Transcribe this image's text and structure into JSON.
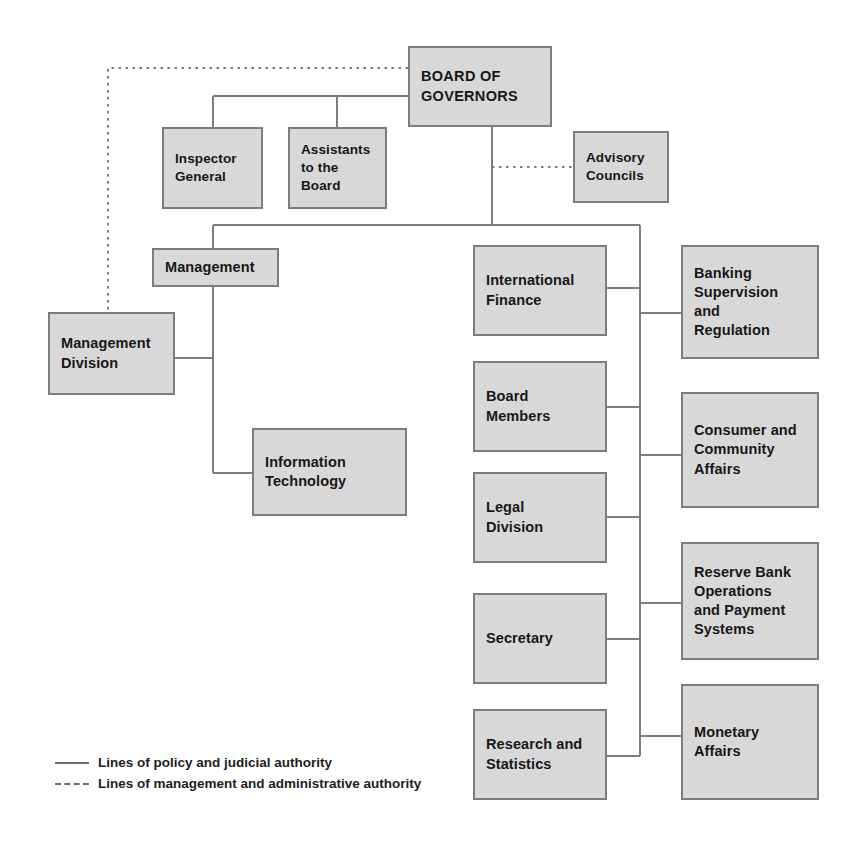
{
  "chart": {
    "type": "organization-chart",
    "title": "",
    "line_color": "#7d7d7d",
    "node_fill": "#d8d8d8",
    "node_border": "#7d7d7d",
    "background": "#ffffff"
  },
  "nodes": {
    "board_of_governors": {
      "label": "BOARD OF\nGOVERNORS"
    },
    "inspector_general": {
      "label": "Inspector\nGeneral"
    },
    "assistants_to_the_board": {
      "label": "Assistants\nto the\nBoard"
    },
    "advisory_councils": {
      "label": "Advisory\nCouncils"
    },
    "management": {
      "label": "Management"
    },
    "management_division": {
      "label": "Management\nDivision"
    },
    "information_technology": {
      "label": "Information\nTechnology"
    },
    "international_finance": {
      "label": "International\nFinance"
    },
    "board_members": {
      "label": "Board\nMembers"
    },
    "legal_division": {
      "label": "Legal\nDivision"
    },
    "secretary": {
      "label": "Secretary"
    },
    "research_and_statistics": {
      "label": "Research and\nStatistics"
    },
    "banking_supervision_and_regulation": {
      "label": "Banking\nSupervision\nand\nRegulation"
    },
    "consumer_and_community_affairs": {
      "label": "Consumer and\nCommunity\nAffairs"
    },
    "reserve_bank_operations_and_payment_systems": {
      "label": "Reserve Bank\nOperations\nand Payment\nSystems"
    },
    "monetary_affairs": {
      "label": "Monetary\nAffairs"
    }
  },
  "legend": {
    "solid": "Lines of policy and judicial authority",
    "dashed": "Lines of management and administrative authority"
  }
}
